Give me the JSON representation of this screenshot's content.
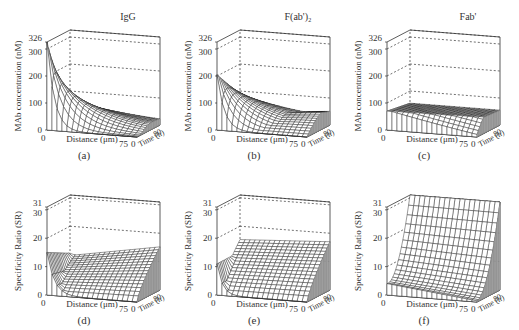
{
  "figure": {
    "rows": 2,
    "cols": 3
  },
  "chart_data": [
    {
      "id": "a",
      "type": "surface3d",
      "title": "IgG",
      "caption": "(a)",
      "zlabel": "MAb concentration (nM)",
      "xlabel": "Distance (μm)",
      "ylabel": "Time (h)",
      "zticks": [
        "0",
        "100",
        "200",
        "300",
        "326"
      ],
      "zlim": [
        0,
        326
      ],
      "xticks": [
        "0",
        "75"
      ],
      "xlim": [
        0,
        75
      ],
      "yticks": [
        "0",
        "80"
      ],
      "ylim": [
        0,
        80
      ],
      "description": "Concentration peaks ~326 nM at distance 0 early; decays steeply with distance at early times; at later times spreads to ~90-100 nM across distance.",
      "profile": {
        "z_at_x0_t0": 326,
        "z_at_x0_t80": 105,
        "z_at_x75_t0": 0,
        "z_at_x75_t80": 90
      }
    },
    {
      "id": "b",
      "type": "surface3d",
      "title": "F(ab')₂",
      "caption": "(b)",
      "zlabel": "MAb concentration (nM)",
      "xlabel": "Distance (μm)",
      "ylabel": "Time (h)",
      "zticks": [
        "0",
        "100",
        "200",
        "300",
        "326"
      ],
      "zlim": [
        0,
        326
      ],
      "xticks": [
        "0",
        "75"
      ],
      "xlim": [
        0,
        75
      ],
      "yticks": [
        "0",
        "80"
      ],
      "ylim": [
        0,
        80
      ],
      "description": "Peak ~205 nM near distance 0 early, decaying to ~80 nM plateau at later times.",
      "profile": {
        "z_at_x0_t0": 205,
        "z_at_x0_t80": 85,
        "z_at_x75_t0": 0,
        "z_at_x75_t80": 80
      }
    },
    {
      "id": "c",
      "type": "surface3d",
      "title": "Fab'",
      "caption": "(c)",
      "zlabel": "MAb concentration (nM)",
      "xlabel": "Distance (μm)",
      "ylabel": "Time (h)",
      "zticks": [
        "0",
        "100",
        "200",
        "300",
        "326"
      ],
      "zlim": [
        0,
        326
      ],
      "xticks": [
        "0",
        "75"
      ],
      "xlim": [
        0,
        75
      ],
      "yticks": [
        "0",
        "80"
      ],
      "ylim": [
        0,
        80
      ],
      "description": "Low, nearly flat surface ~60-75 nM across distance and time.",
      "profile": {
        "z_at_x0_t0": 70,
        "z_at_x0_t80": 55,
        "z_at_x75_t0": 5,
        "z_at_x75_t80": 60
      }
    },
    {
      "id": "d",
      "type": "surface3d",
      "title": "",
      "caption": "(d)",
      "zlabel": "Specificity Ratio (SR)",
      "xlabel": "Distance (μm)",
      "ylabel": "Time (h)",
      "zticks": [
        "0",
        "10",
        "20",
        "30",
        "31"
      ],
      "zlim": [
        0,
        31
      ],
      "xticks": [
        "0",
        "75"
      ],
      "xlim": [
        0,
        75
      ],
      "yticks": [
        "0",
        "80"
      ],
      "ylim": [
        0,
        80
      ],
      "description": "SR ~15 at distance 0 early, dips then rises with time up to ~12-13 at later times.",
      "profile": {
        "z_at_x0_t0": 15,
        "z_at_x0_t80": 12,
        "z_at_x75_t0": 0,
        "z_at_x75_t80": 12
      }
    },
    {
      "id": "e",
      "type": "surface3d",
      "title": "",
      "caption": "(e)",
      "zlabel": "Specificity Ratio (SR)",
      "xlabel": "Distance (μm)",
      "ylabel": "Time (h)",
      "zticks": [
        "0",
        "10",
        "20",
        "30",
        "31"
      ],
      "zlim": [
        0,
        31
      ],
      "xticks": [
        "0",
        "75"
      ],
      "xlim": [
        0,
        75
      ],
      "yticks": [
        "0",
        "80"
      ],
      "ylim": [
        0,
        80
      ],
      "description": "SR ~11 at distance 0 early, rising with time to ~17 at later times.",
      "profile": {
        "z_at_x0_t0": 11,
        "z_at_x0_t80": 17,
        "z_at_x75_t0": 0,
        "z_at_x75_t80": 16
      }
    },
    {
      "id": "f",
      "type": "surface3d",
      "title": "",
      "caption": "(f)",
      "zlabel": "Specificity Ratio (SR)",
      "xlabel": "Distance (μm)",
      "ylabel": "Time (h)",
      "zticks": [
        "0",
        "10",
        "20",
        "30",
        "31"
      ],
      "zlim": [
        0,
        31
      ],
      "xticks": [
        "0",
        "75"
      ],
      "xlim": [
        0,
        75
      ],
      "yticks": [
        "0",
        "80"
      ],
      "ylim": [
        0,
        80
      ],
      "description": "SR starts ~4 at early times, rising steeply with time to ~31 at 80 h across all distances.",
      "profile": {
        "z_at_x0_t0": 4,
        "z_at_x0_t80": 31,
        "z_at_x75_t0": 0,
        "z_at_x75_t80": 31
      }
    }
  ]
}
